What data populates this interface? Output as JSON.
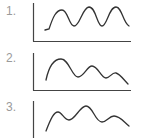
{
  "panels": [
    {
      "label": "1.",
      "description": "regular periodic wave with three equal peaks"
    },
    {
      "label": "2.",
      "description": "wave with decreasing peak amplitude"
    },
    {
      "label": "3.",
      "description": "irregular wave with varying peaks"
    }
  ],
  "colors": {
    "stroke": "#333333",
    "axis": "#444444",
    "label": "#9a9a9a"
  }
}
